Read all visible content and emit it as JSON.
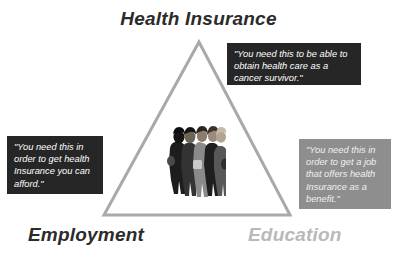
{
  "diagram": {
    "type": "triangle-relationship-diagram",
    "background_color": "#ffffff",
    "triangle": {
      "stroke_color": "#a9a9a9",
      "stroke_width": 3,
      "apex": {
        "x": 199,
        "y": 42
      },
      "bottom_left": {
        "x": 104,
        "y": 215
      },
      "bottom_right": {
        "x": 290,
        "y": 215
      }
    },
    "vertices": [
      {
        "id": "health-insurance",
        "label": "Health Insurance",
        "color": "#2b2b2b",
        "position": "top"
      },
      {
        "id": "employment",
        "label": "Employment",
        "color": "#2b2b2b",
        "position": "bottom-left"
      },
      {
        "id": "education",
        "label": "Education",
        "color": "#b9b9b9",
        "position": "bottom-right"
      }
    ],
    "callouts": [
      {
        "id": "health-insurance-callout",
        "attached_to": "health-insurance",
        "style": "dark",
        "background_color": "#262626",
        "text_color": "#ffffff",
        "text": "\"You need this to be able to obtain health care as a cancer survivor.\""
      },
      {
        "id": "employment-callout",
        "attached_to": "employment",
        "style": "dark",
        "background_color": "#262626",
        "text_color": "#ffffff",
        "text": "\"You need this in order to get health Insurance you can afford.\""
      },
      {
        "id": "education-callout",
        "attached_to": "education",
        "style": "grey",
        "background_color": "#8e8e8e",
        "text_color": "#f0f0f0",
        "text": "\"You need this in order to get a job that offers health Insurance as a benefit.\""
      }
    ],
    "center_image": {
      "id": "group-of-people-photo",
      "description": "Grayscale photograph of a group of five young people standing close together",
      "people_count": 5
    }
  }
}
